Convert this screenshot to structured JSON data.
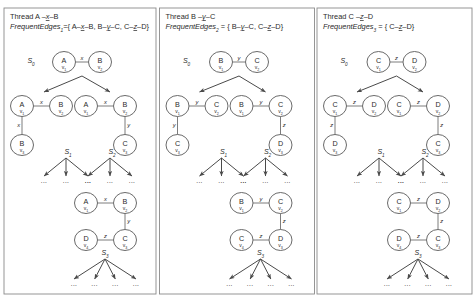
{
  "figure": {
    "name": "parallel-frequent-subgraph-thread-search-trees",
    "width": 476,
    "height": 302,
    "background": "#ffffff",
    "panel_border_color": "#8a8a8a",
    "node_stroke_color": "#595959",
    "edge_stroke_color": "#6e6e6e",
    "arrow_color": "#4a4a4a",
    "text_color": "#2b2b2b",
    "ellipsis": "...",
    "frequent_edges_prefix": "FrequentEdges"
  },
  "panels": [
    {
      "id": "thread-1",
      "thread_label": "Thread A",
      "thread_edge": "x",
      "thread_target": "B",
      "frequent_edges_sub": "1",
      "frequent_edges_eq": "={",
      "frequent_edges_items": [
        {
          "from": "A",
          "label": "x",
          "to": "B"
        },
        {
          "from": "B",
          "label": "y",
          "to": "C"
        },
        {
          "from": "C",
          "label": "z",
          "to": "D"
        }
      ],
      "frequent_edges_close": "}",
      "states": [
        {
          "name": "S",
          "sub": "0"
        },
        {
          "name": "S",
          "sub": "1"
        },
        {
          "name": "S",
          "sub": "2"
        },
        {
          "name": "S",
          "sub": "3"
        }
      ],
      "graphs": {
        "root": {
          "nodes": [
            {
              "id": "n1",
              "label": "A",
              "sub": "v",
              "subnum": "1"
            },
            {
              "id": "n2",
              "label": "B",
              "sub": "v",
              "subnum": "2"
            }
          ],
          "edges": [
            {
              "from": "n1",
              "to": "n2",
              "label": "x"
            }
          ]
        },
        "left_child": {
          "nodes": [
            {
              "id": "n1",
              "label": "A",
              "sub": "v",
              "subnum": "1"
            },
            {
              "id": "n2",
              "label": "B",
              "sub": "v",
              "subnum": "2"
            },
            {
              "id": "n3",
              "label": "B",
              "sub": "v",
              "subnum": "3"
            }
          ],
          "edges": [
            {
              "from": "n1",
              "to": "n2",
              "label": "x"
            },
            {
              "from": "n1",
              "to": "n3",
              "label": "x"
            }
          ]
        },
        "right_child": {
          "nodes": [
            {
              "id": "n1",
              "label": "A",
              "sub": "v",
              "subnum": "1"
            },
            {
              "id": "n2",
              "label": "B",
              "sub": "v",
              "subnum": "2"
            },
            {
              "id": "n3",
              "label": "C",
              "sub": "v",
              "subnum": "3"
            }
          ],
          "edges": [
            {
              "from": "n1",
              "to": "n2",
              "label": "x"
            },
            {
              "from": "n2",
              "to": "n3",
              "label": "y"
            }
          ]
        },
        "deep": {
          "nodes": [
            {
              "id": "n1",
              "label": "A",
              "sub": "v",
              "subnum": "1"
            },
            {
              "id": "n2",
              "label": "B",
              "sub": "v",
              "subnum": "2"
            },
            {
              "id": "n3",
              "label": "C",
              "sub": "v",
              "subnum": "3"
            },
            {
              "id": "n4",
              "label": "D",
              "sub": "v",
              "subnum": "4"
            }
          ],
          "edges": [
            {
              "from": "n1",
              "to": "n2",
              "label": "x"
            },
            {
              "from": "n2",
              "to": "n3",
              "label": "y"
            },
            {
              "from": "n4",
              "to": "n3",
              "label": "z"
            }
          ]
        }
      },
      "leaf_counts": {
        "s1": 3,
        "s2": 3,
        "s3": 4
      }
    },
    {
      "id": "thread-2",
      "thread_label": "Thread B",
      "thread_edge": "y",
      "thread_target": "C",
      "frequent_edges_sub": "2",
      "frequent_edges_eq": " = {",
      "frequent_edges_items": [
        {
          "from": "B",
          "label": "y",
          "to": "C"
        },
        {
          "from": "C",
          "label": "z",
          "to": "D"
        }
      ],
      "frequent_edges_close": "}",
      "states": [
        {
          "name": "S",
          "sub": "0"
        },
        {
          "name": "S",
          "sub": "1"
        },
        {
          "name": "S",
          "sub": "2"
        },
        {
          "name": "S",
          "sub": "3"
        }
      ],
      "graphs": {
        "root": {
          "nodes": [
            {
              "id": "n1",
              "label": "B",
              "sub": "v",
              "subnum": "1"
            },
            {
              "id": "n2",
              "label": "C",
              "sub": "v",
              "subnum": "2"
            }
          ],
          "edges": [
            {
              "from": "n1",
              "to": "n2",
              "label": "y"
            }
          ]
        },
        "left_child": {
          "nodes": [
            {
              "id": "n1",
              "label": "B",
              "sub": "v",
              "subnum": "1"
            },
            {
              "id": "n2",
              "label": "C",
              "sub": "v",
              "subnum": "2"
            },
            {
              "id": "n3",
              "label": "C",
              "sub": "v",
              "subnum": "3"
            }
          ],
          "edges": [
            {
              "from": "n1",
              "to": "n2",
              "label": "y"
            },
            {
              "from": "n1",
              "to": "n3",
              "label": "y"
            }
          ]
        },
        "right_child": {
          "nodes": [
            {
              "id": "n1",
              "label": "B",
              "sub": "v",
              "subnum": "1"
            },
            {
              "id": "n2",
              "label": "C",
              "sub": "v",
              "subnum": "2"
            },
            {
              "id": "n3",
              "label": "D",
              "sub": "v",
              "subnum": "3"
            }
          ],
          "edges": [
            {
              "from": "n1",
              "to": "n2",
              "label": "y"
            },
            {
              "from": "n2",
              "to": "n3",
              "label": "z"
            }
          ]
        },
        "deep": {
          "nodes": [
            {
              "id": "n1",
              "label": "B",
              "sub": "v",
              "subnum": "1"
            },
            {
              "id": "n2",
              "label": "C",
              "sub": "v",
              "subnum": "2"
            },
            {
              "id": "n3",
              "label": "D",
              "sub": "v",
              "subnum": "3"
            },
            {
              "id": "n4",
              "label": "C",
              "sub": "v",
              "subnum": "4"
            }
          ],
          "edges": [
            {
              "from": "n1",
              "to": "n2",
              "label": "y"
            },
            {
              "from": "n2",
              "to": "n3",
              "label": "z"
            },
            {
              "from": "n4",
              "to": "n3",
              "label": "z"
            }
          ]
        }
      },
      "leaf_counts": {
        "s1": 3,
        "s2": 3,
        "s3": 4
      }
    },
    {
      "id": "thread-3",
      "thread_label": "Thread C",
      "thread_edge": "z",
      "thread_target": "D",
      "frequent_edges_sub": "3",
      "frequent_edges_eq": " = {",
      "frequent_edges_items": [
        {
          "from": "C",
          "label": "z",
          "to": "D"
        }
      ],
      "frequent_edges_close": "}",
      "states": [
        {
          "name": "S",
          "sub": "0"
        },
        {
          "name": "S",
          "sub": "1"
        },
        {
          "name": "S",
          "sub": "2"
        },
        {
          "name": "S",
          "sub": "3"
        }
      ],
      "graphs": {
        "root": {
          "nodes": [
            {
              "id": "n1",
              "label": "C",
              "sub": "v",
              "subnum": "1"
            },
            {
              "id": "n2",
              "label": "D",
              "sub": "v",
              "subnum": "2"
            }
          ],
          "edges": [
            {
              "from": "n1",
              "to": "n2",
              "label": "z"
            }
          ]
        },
        "left_child": {
          "nodes": [
            {
              "id": "n1",
              "label": "C",
              "sub": "v",
              "subnum": "1"
            },
            {
              "id": "n2",
              "label": "D",
              "sub": "v",
              "subnum": "2"
            },
            {
              "id": "n3",
              "label": "D",
              "sub": "v",
              "subnum": "3"
            }
          ],
          "edges": [
            {
              "from": "n1",
              "to": "n2",
              "label": "z"
            },
            {
              "from": "n1",
              "to": "n3",
              "label": "z"
            }
          ]
        },
        "right_child": {
          "nodes": [
            {
              "id": "n1",
              "label": "C",
              "sub": "v",
              "subnum": "1"
            },
            {
              "id": "n2",
              "label": "D",
              "sub": "v",
              "subnum": "2"
            },
            {
              "id": "n3",
              "label": "C",
              "sub": "v",
              "subnum": "3"
            }
          ],
          "edges": [
            {
              "from": "n1",
              "to": "n2",
              "label": "z"
            },
            {
              "from": "n2",
              "to": "n3",
              "label": "z"
            }
          ]
        },
        "deep": {
          "nodes": [
            {
              "id": "n1",
              "label": "C",
              "sub": "v",
              "subnum": "1"
            },
            {
              "id": "n2",
              "label": "D",
              "sub": "v",
              "subnum": "2"
            },
            {
              "id": "n3",
              "label": "C",
              "sub": "v",
              "subnum": "3"
            },
            {
              "id": "n4",
              "label": "D",
              "sub": "v",
              "subnum": "4"
            }
          ],
          "edges": [
            {
              "from": "n1",
              "to": "n2",
              "label": "z"
            },
            {
              "from": "n2",
              "to": "n3",
              "label": "z"
            },
            {
              "from": "n4",
              "to": "n3",
              "label": "z"
            }
          ]
        }
      },
      "leaf_counts": {
        "s1": 3,
        "s2": 3,
        "s3": 4
      }
    }
  ]
}
